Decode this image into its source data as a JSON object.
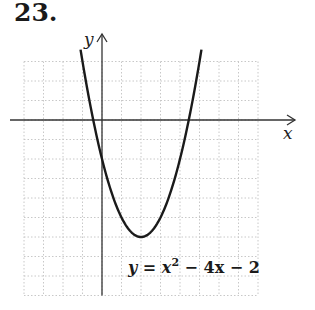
{
  "problem_number": "23.",
  "chart_data": {
    "type": "line",
    "title": "",
    "function": "y = x^2 - 4x - 2",
    "equation_label": {
      "lhs": "y = x",
      "exp": "2",
      "rhs": " − 4x − 2"
    },
    "xlabel": "x",
    "ylabel": "y",
    "xlim": [
      -4,
      8
    ],
    "ylim": [
      -9,
      3
    ],
    "grid": true,
    "grid_step": 1,
    "curve_domain": [
      -1.1,
      5.1
    ],
    "vertex": [
      2,
      -6
    ],
    "y_intercept": -2,
    "x_intercepts": [
      -0.449,
      4.449
    ],
    "points": [
      [
        -1,
        3
      ],
      [
        0,
        -2
      ],
      [
        1,
        -5
      ],
      [
        2,
        -6
      ],
      [
        3,
        -5
      ],
      [
        4,
        -2
      ],
      [
        5,
        3
      ]
    ],
    "legend": "none"
  },
  "colors": {
    "grid": "#c8c8c8",
    "axis": "#333333",
    "curve": "#1a1a1a"
  }
}
